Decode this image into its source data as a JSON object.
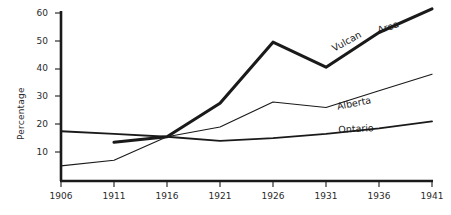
{
  "chart_data": {
    "type": "line",
    "title": "",
    "xlabel": "",
    "ylabel": "Percentage",
    "x": [
      1906,
      1911,
      1916,
      1921,
      1926,
      1931,
      1936,
      1941
    ],
    "xtick_labels": [
      "1906",
      "1911",
      "1916",
      "1921",
      "1926",
      "1931",
      "1936",
      "1941"
    ],
    "ytick_labels": [
      "10",
      "20",
      "30",
      "40",
      "50",
      "60"
    ],
    "yticks": [
      10,
      20,
      30,
      40,
      50,
      60
    ],
    "xlim": [
      1906,
      1941
    ],
    "ylim": [
      0,
      62
    ],
    "grid": false,
    "legend": "inline-labels",
    "series": [
      {
        "name": "Vulcan Area",
        "label_parts": [
          "Vulcan",
          "Area"
        ],
        "x": [
          1911,
          1916,
          1921,
          1926,
          1931,
          1936,
          1941
        ],
        "values": [
          13.5,
          15.5,
          27.5,
          49.5,
          40.5,
          53,
          61.5
        ],
        "style": "thick"
      },
      {
        "name": "Alberta",
        "label_parts": [
          "Alberta"
        ],
        "x": [
          1906,
          1911,
          1916,
          1921,
          1926,
          1931,
          1936,
          1941
        ],
        "values": [
          5,
          7,
          15.5,
          19,
          28,
          26,
          32,
          38
        ],
        "style": "thin"
      },
      {
        "name": "Ontario",
        "label_parts": [
          "Ontario"
        ],
        "x": [
          1906,
          1911,
          1916,
          1921,
          1926,
          1931,
          1936,
          1941
        ],
        "values": [
          17.5,
          16.5,
          15.5,
          14,
          15,
          16.5,
          18.5,
          21
        ],
        "style": "medium"
      }
    ],
    "colors": {
      "axis": "#1a1a1a",
      "vulcan": "#1a1a1a",
      "alberta": "#1a1a1a",
      "ontario": "#1a1a1a",
      "background": "#ffffff"
    }
  },
  "labels": {
    "y_axis_title": "Percentage",
    "vulcan": "Vulcan",
    "area": "Area",
    "alberta": "Alberta",
    "ontario": "Ontario"
  }
}
